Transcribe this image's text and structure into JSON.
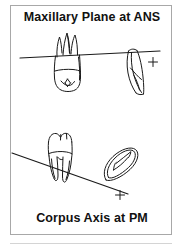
{
  "figure": {
    "title_top": "Maxillary Plane at ANS",
    "title_bottom": "Corpus Axis at PM",
    "background_color": "#ffffff",
    "frame_color": "#a8a8a8",
    "ink_color": "#1a1a1a"
  },
  "diagram": {
    "planes": [
      {
        "name": "maxillary-plane",
        "label": "Maxillary Plane at ANS",
        "x1": 20,
        "y1": 53,
        "x2": 152,
        "y2": 47
      },
      {
        "name": "corpus-axis",
        "label": "Corpus Axis at PM",
        "x1": 2,
        "y1": 148,
        "x2": 120,
        "y2": 190
      }
    ],
    "markers": [
      {
        "name": "ans-point",
        "x": 143,
        "y": 57
      },
      {
        "name": "pm-point",
        "x": 110,
        "y": 190
      }
    ],
    "teeth": [
      {
        "name": "upper-molar-inverted",
        "position": "upper-left",
        "type": "molar"
      },
      {
        "name": "upper-incisor",
        "position": "upper-right",
        "type": "incisor"
      },
      {
        "name": "lower-molar",
        "position": "lower-left",
        "type": "molar"
      },
      {
        "name": "lower-incisor",
        "position": "lower-right",
        "type": "incisor"
      }
    ]
  }
}
